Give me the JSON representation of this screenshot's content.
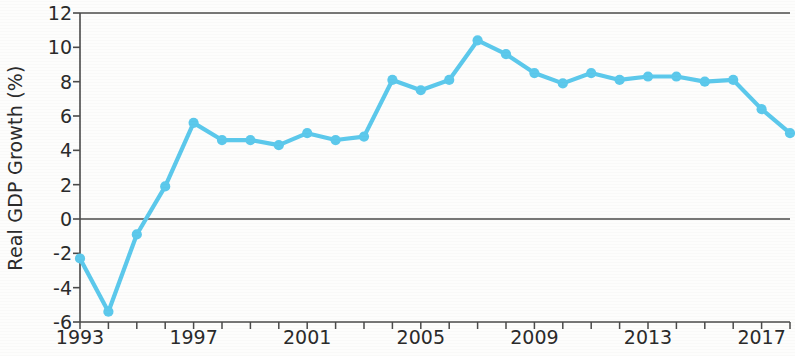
{
  "chart_data": {
    "type": "line",
    "title": "",
    "xlabel": "",
    "ylabel": "Real GDP Growth (%)",
    "xlim": [
      1993,
      2018
    ],
    "ylim": [
      -6,
      12
    ],
    "y_ticks": [
      -6,
      -4,
      -2,
      0,
      2,
      4,
      6,
      8,
      10,
      12
    ],
    "y_tick_labels": [
      "-6",
      "-4",
      "-2",
      "0",
      "2",
      "4",
      "6",
      "8",
      "10",
      "12"
    ],
    "x_ticks": [
      1993,
      1994,
      1995,
      1996,
      1997,
      1998,
      1999,
      2000,
      2001,
      2002,
      2003,
      2004,
      2005,
      2006,
      2007,
      2008,
      2009,
      2010,
      2011,
      2012,
      2013,
      2014,
      2015,
      2016,
      2017,
      2018
    ],
    "x_tick_labels_shown": [
      "1993",
      "1997",
      "2001",
      "2005",
      "2009",
      "2013",
      "2017"
    ],
    "x_labeled_ticks": [
      1993,
      1997,
      2001,
      2005,
      2009,
      2013,
      2017
    ],
    "grid": false,
    "legend": false,
    "zero_line": true,
    "series": [
      {
        "name": "Real GDP Growth (%)",
        "color": "#5cc9ec",
        "marker": "circle",
        "x": [
          1993,
          1994,
          1995,
          1996,
          1997,
          1998,
          1999,
          2000,
          2001,
          2002,
          2003,
          2004,
          2005,
          2006,
          2007,
          2008,
          2009,
          2010,
          2011,
          2012,
          2013,
          2014,
          2015,
          2016,
          2017,
          2018
        ],
        "values": [
          -2.3,
          -5.4,
          -0.9,
          1.9,
          5.6,
          4.6,
          4.6,
          4.3,
          5.0,
          4.6,
          4.8,
          8.1,
          7.5,
          8.1,
          10.4,
          9.6,
          8.5,
          7.9,
          8.5,
          8.1,
          8.3,
          8.3,
          8.0,
          8.1,
          6.4,
          5.0
        ]
      }
    ]
  },
  "axis": {
    "ylabel_text": "Real GDP Growth (%)"
  }
}
